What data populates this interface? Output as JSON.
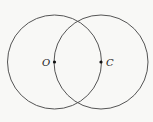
{
  "diagram": {
    "type": "two-intersecting-circles",
    "stroke_color": "#555555",
    "background": "#f8f8f6",
    "circles": [
      {
        "name": "circle-o",
        "cx": 54.5,
        "cy": 62,
        "r": 47
      },
      {
        "name": "circle-c",
        "cx": 101,
        "cy": 62,
        "r": 47
      }
    ],
    "points": [
      {
        "name": "point-o",
        "label": "O",
        "x": 54.5,
        "y": 62,
        "label_x": 42,
        "label_y": 65.5
      },
      {
        "name": "point-c",
        "label": "C",
        "x": 101,
        "y": 62,
        "label_x": 106,
        "label_y": 65.5
      }
    ]
  }
}
